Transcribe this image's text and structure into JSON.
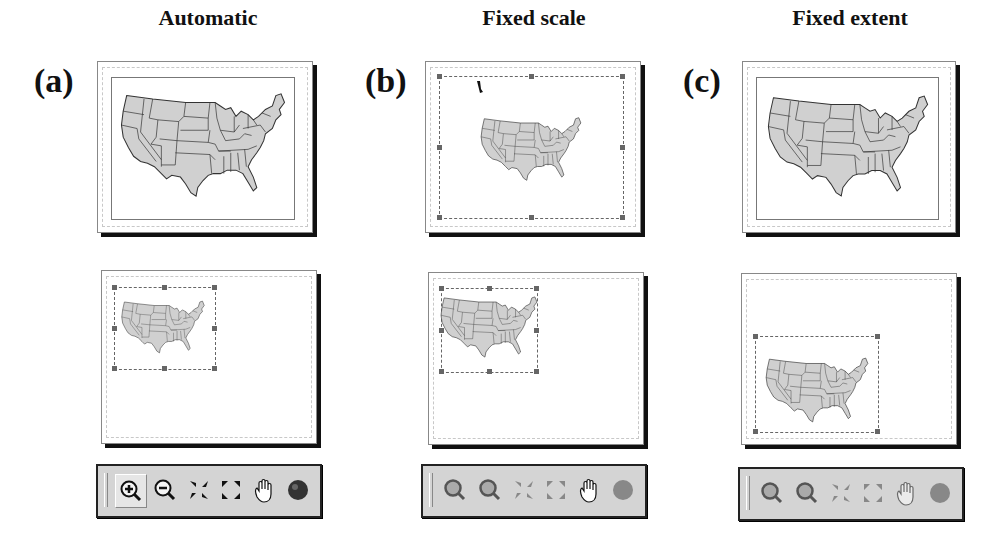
{
  "columns": [
    {
      "title": "Automatic",
      "label": "(a)",
      "toolbar_state": "enabled",
      "tools": [
        {
          "name": "zoom-in-icon",
          "pressed": true
        },
        {
          "name": "zoom-out-icon",
          "pressed": false
        },
        {
          "name": "fixed-zoom-in-icon",
          "pressed": false
        },
        {
          "name": "fixed-zoom-out-icon",
          "pressed": false
        },
        {
          "name": "pan-hand-icon",
          "pressed": false
        },
        {
          "name": "full-extent-globe-icon",
          "pressed": false
        }
      ]
    },
    {
      "title": "Fixed scale",
      "label": "(b)",
      "toolbar_state": "disabled",
      "tools": [
        {
          "name": "zoom-in-icon",
          "pressed": false
        },
        {
          "name": "zoom-out-icon",
          "pressed": false
        },
        {
          "name": "fixed-zoom-in-icon",
          "pressed": false
        },
        {
          "name": "fixed-zoom-out-icon",
          "pressed": false
        },
        {
          "name": "pan-hand-icon",
          "pressed": false
        },
        {
          "name": "full-extent-globe-icon",
          "pressed": false
        }
      ]
    },
    {
      "title": "Fixed extent",
      "label": "(c)",
      "toolbar_state": "disabled",
      "tools": [
        {
          "name": "zoom-in-icon",
          "pressed": false
        },
        {
          "name": "zoom-out-icon",
          "pressed": false
        },
        {
          "name": "fixed-zoom-in-icon",
          "pressed": false
        },
        {
          "name": "fixed-zoom-out-icon",
          "pressed": false
        },
        {
          "name": "pan-hand-icon",
          "pressed": false
        },
        {
          "name": "full-extent-globe-icon",
          "pressed": false
        }
      ]
    }
  ],
  "colors": {
    "map_fill": "#d0d0d0",
    "map_stroke": "#333333",
    "toolbar_bg": "#d4d4d4",
    "handle": "#666666"
  }
}
